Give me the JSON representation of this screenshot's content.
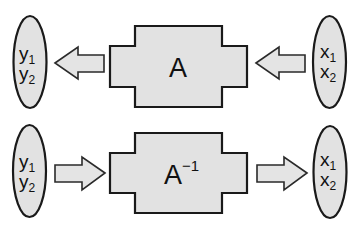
{
  "diagram": {
    "top_row": {
      "left_vector": {
        "v1": "y",
        "v1_sub": "1",
        "v2": "y",
        "v2_sub": "2"
      },
      "operator": {
        "label": "A",
        "superscript": ""
      },
      "right_vector": {
        "v1": "x",
        "v1_sub": "1",
        "v2": "x",
        "v2_sub": "2"
      },
      "flow_direction": "right-to-left"
    },
    "bottom_row": {
      "left_vector": {
        "v1": "y",
        "v1_sub": "1",
        "v2": "y",
        "v2_sub": "2"
      },
      "operator": {
        "label": "A",
        "superscript": "−1"
      },
      "right_vector": {
        "v1": "x",
        "v1_sub": "1",
        "v2": "x",
        "v2_sub": "2"
      },
      "flow_direction": "left-to-right"
    },
    "colors": {
      "fill": "#e2e2e2",
      "stroke": "#1a1a1a",
      "background": "#ffffff"
    }
  }
}
